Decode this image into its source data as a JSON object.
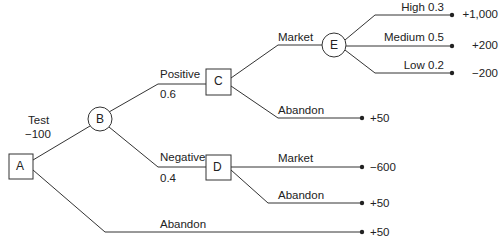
{
  "diagram": {
    "type": "decision-tree",
    "nodes": {
      "A": {
        "label": "A",
        "shape": "square"
      },
      "B": {
        "label": "B",
        "shape": "circle"
      },
      "C": {
        "label": "C",
        "shape": "square"
      },
      "D": {
        "label": "D",
        "shape": "square"
      },
      "E": {
        "label": "E",
        "shape": "circle"
      }
    },
    "branches": {
      "test": {
        "label": "Test",
        "value": "−100"
      },
      "positive": {
        "label": "Positive",
        "prob": "0.6"
      },
      "negative": {
        "label": "Negative",
        "prob": "0.4"
      },
      "a_abandon": {
        "label": "Abandon",
        "payoff": "+50"
      },
      "c_market": {
        "label": "Market"
      },
      "c_abandon": {
        "label": "Abandon",
        "payoff": "+50"
      },
      "d_market": {
        "label": "Market",
        "payoff": "−600"
      },
      "d_abandon": {
        "label": "Abandon",
        "payoff": "+50"
      },
      "high": {
        "label": "High  0.3",
        "payoff": "+1,000"
      },
      "medium": {
        "label": "Medium 0.5",
        "payoff": "+200"
      },
      "low": {
        "label": "Low 0.2",
        "payoff": "−200"
      }
    },
    "colors": {
      "line": "#333333",
      "background": "#ffffff"
    }
  }
}
